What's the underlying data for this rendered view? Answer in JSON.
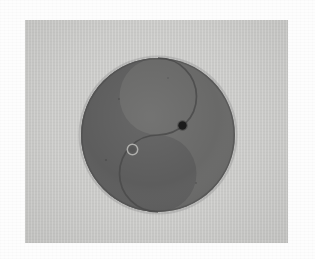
{
  "page": {
    "background_color": "#fdfdfd",
    "width": 315,
    "height": 259,
    "caption": ""
  },
  "plate": {
    "name": "photographic-plate",
    "background_color": "#c9c9c7",
    "x": 25,
    "y": 20,
    "width": 263,
    "height": 223
  },
  "symbol": {
    "name": "taijitu",
    "label": "Yin-Yang (Taijitu)",
    "center_x": 158,
    "center_y": 135,
    "radius": 77,
    "outline_color": "#4a4a4a",
    "yin_color": "#5d5d5d",
    "yang_color": "#696968",
    "halves": [
      {
        "name": "yang-half",
        "position": "upper-right",
        "fill": "#696968"
      },
      {
        "name": "yin-half",
        "position": "lower-left",
        "fill": "#5d5d5d"
      }
    ],
    "eyes": [
      {
        "name": "yin-eye-dot",
        "type": "solid-dot",
        "center_x": 182.5,
        "center_y": 125.5,
        "radius": 4.2,
        "fill": "#1b1b1b"
      },
      {
        "name": "yang-eye-ring",
        "type": "ring",
        "center_x": 132.5,
        "center_y": 149.5,
        "outer_radius": 5.2,
        "inner_radius": 3.0,
        "stroke": "#b9b9b6",
        "inner_fill": "#5a5a5a"
      }
    ]
  }
}
